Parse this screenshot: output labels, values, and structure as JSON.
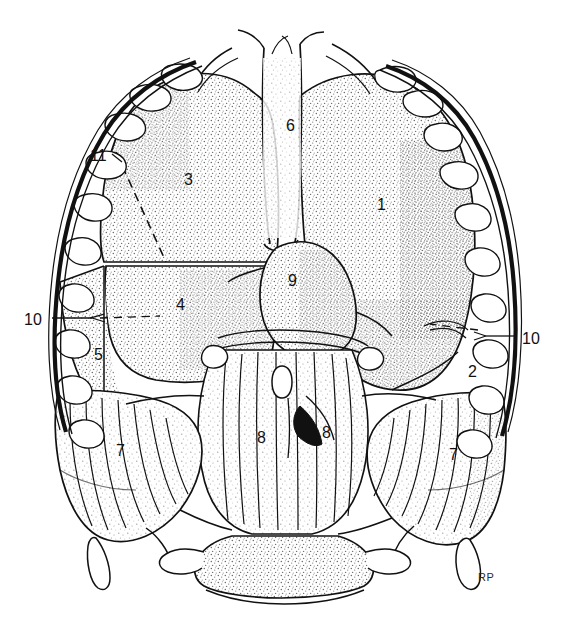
{
  "figure": {
    "title_cropped": "Punctured",
    "signature": "RP",
    "medium": "pen-and-ink stipple line drawing",
    "background_color": "#ffffff",
    "ink_color": "#111111",
    "stipple_color": "#555555"
  },
  "labels": [
    {
      "id": "label-1",
      "text": "1",
      "x": 377,
      "y": 197,
      "leader": false
    },
    {
      "id": "label-2",
      "text": "2",
      "x": 468,
      "y": 364,
      "leader": false
    },
    {
      "id": "label-3",
      "text": "3",
      "x": 184,
      "y": 172,
      "leader": false
    },
    {
      "id": "label-4",
      "text": "4",
      "x": 176,
      "y": 297,
      "leader": false
    },
    {
      "id": "label-5",
      "text": "5",
      "x": 94,
      "y": 347,
      "leader": false
    },
    {
      "id": "label-6",
      "text": "6",
      "x": 286,
      "y": 118,
      "leader": false
    },
    {
      "id": "label-7L",
      "text": "7",
      "x": 116,
      "y": 443,
      "leader": false
    },
    {
      "id": "label-7R",
      "text": "7",
      "x": 449,
      "y": 447,
      "leader": false
    },
    {
      "id": "label-8L",
      "text": "8",
      "x": 257,
      "y": 430,
      "leader": false
    },
    {
      "id": "label-8R",
      "text": "8",
      "x": 322,
      "y": 425,
      "leader": false
    },
    {
      "id": "label-9",
      "text": "9",
      "x": 288,
      "y": 273,
      "leader": false
    },
    {
      "id": "label-10L",
      "text": "10",
      "x": 28,
      "y": 312,
      "leader": true
    },
    {
      "id": "label-10R",
      "text": "10",
      "x": 520,
      "y": 331,
      "leader": true
    },
    {
      "id": "label-11",
      "text": "11",
      "x": 92,
      "y": 148,
      "leader": true
    }
  ],
  "legend_keys": {
    "1": "right lung",
    "2": "right lung caudal lobe",
    "3": "left lung cranial lobe",
    "4": "left lung middle lobe",
    "5": "left lung caudal lobe",
    "6": "trachea",
    "7": "diaphragm muscular part",
    "8": "diaphragm crus",
    "9": "heart",
    "10": "costal arch",
    "11": "rib"
  }
}
